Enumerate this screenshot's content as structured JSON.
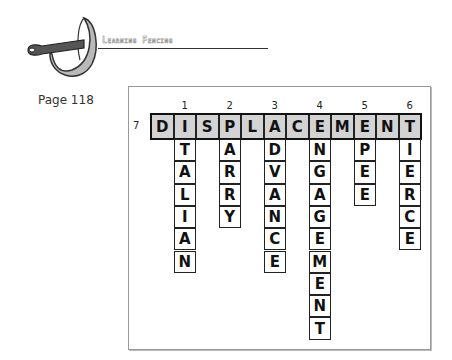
{
  "header": {
    "title": "Learning Fencing",
    "logo_icon": "sabre-guard-icon"
  },
  "page": {
    "label": "Page 118"
  },
  "puzzle": {
    "across": {
      "number": "7",
      "word": "DISPLACEMENT"
    },
    "down": [
      {
        "number": "1",
        "col": 1,
        "word": "ITALIAN"
      },
      {
        "number": "2",
        "col": 3,
        "word": "PARRY"
      },
      {
        "number": "3",
        "col": 5,
        "word": "ADVANCE"
      },
      {
        "number": "4",
        "col": 7,
        "word": "ENGAGEMENT"
      },
      {
        "number": "5",
        "col": 9,
        "word": "EPEE"
      },
      {
        "number": "6",
        "col": 11,
        "word": "TIERCE"
      }
    ],
    "colors": {
      "across_fill": "#d3d3d3",
      "cell_fill": "#ffffff",
      "border": "#222222"
    }
  }
}
